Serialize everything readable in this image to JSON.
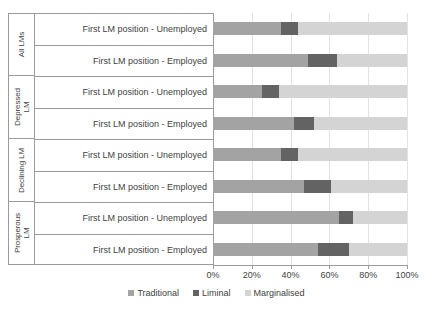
{
  "chart_data": {
    "type": "bar",
    "orientation": "horizontal",
    "stacked": true,
    "stack_total": 100,
    "title": "",
    "xlabel": "",
    "ylabel": "",
    "xlim": [
      0,
      100
    ],
    "xticks": [
      "0%",
      "20%",
      "40%",
      "60%",
      "80%",
      "100%"
    ],
    "xtick_values": [
      0,
      20,
      40,
      60,
      80,
      100
    ],
    "grid": true,
    "legend_position": "bottom",
    "legend": [
      "Traditional",
      "Liminal",
      "Marginalised"
    ],
    "colors": {
      "traditional": "#a3a3a3",
      "liminal": "#636363",
      "marginalised": "#d4d4d4",
      "axis": "#9b9b9b",
      "grid": "#e2e2e2",
      "text": "#3f3f3f",
      "background": "#ffffff"
    },
    "groups": [
      {
        "label": "All LMs"
      },
      {
        "label": "Depressed\nLM"
      },
      {
        "label": "Declining LM"
      },
      {
        "label": "Prosperous\nLM"
      }
    ],
    "categories": [
      "First LM position - Unemployed",
      "First LM position - Employed",
      "First LM position - Unemployed",
      "First LM position - Employed",
      "First LM position - Unemployed",
      "First LM position - Employed",
      "First LM position - Unemployed",
      "First LM position - Employed"
    ],
    "series": [
      {
        "name": "Traditional",
        "values": [
          35,
          49,
          25,
          42,
          35,
          47,
          65,
          54
        ]
      },
      {
        "name": "Liminal",
        "values": [
          9,
          15,
          9,
          10,
          9,
          14,
          7,
          16
        ]
      },
      {
        "name": "Marginalised",
        "values": [
          56,
          36,
          66,
          48,
          56,
          39,
          28,
          30
        ]
      }
    ]
  }
}
